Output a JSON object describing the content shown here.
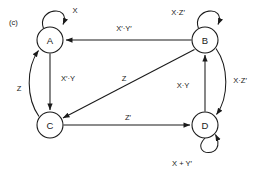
{
  "figure": {
    "caption": "(c)",
    "type": "state-transition-diagram",
    "stroke_color": "#1a1a1a",
    "background_color": "#ffffff"
  },
  "states": [
    {
      "id": "A",
      "label": "A",
      "cx": 50,
      "cy": 40,
      "r": 13
    },
    {
      "id": "B",
      "label": "B",
      "cx": 205,
      "cy": 40,
      "r": 13
    },
    {
      "id": "C",
      "label": "C",
      "cx": 50,
      "cy": 125,
      "r": 13
    },
    {
      "id": "D",
      "label": "D",
      "cx": 205,
      "cy": 125,
      "r": 13
    }
  ],
  "transitions": [
    {
      "from": "A",
      "to": "A",
      "label": "X",
      "kind": "self-loop",
      "label_x": 75,
      "label_y": 10
    },
    {
      "from": "B",
      "to": "B",
      "label": "X·Z′",
      "kind": "self-loop",
      "label_x": 178,
      "label_y": 12
    },
    {
      "from": "D",
      "to": "D",
      "label": "X + Y′",
      "kind": "self-loop",
      "label_x": 182,
      "label_y": 163
    },
    {
      "from": "B",
      "to": "A",
      "label": "X′·Y′",
      "kind": "straight",
      "label_x": 124,
      "label_y": 28
    },
    {
      "from": "A",
      "to": "C",
      "label": "X′·Y",
      "kind": "straight",
      "label_x": 68,
      "label_y": 78
    },
    {
      "from": "C",
      "to": "A",
      "label": "Z",
      "kind": "curved",
      "label_x": 19,
      "label_y": 88
    },
    {
      "from": "B",
      "to": "C",
      "label": "Z",
      "kind": "diagonal",
      "label_x": 124,
      "label_y": 78
    },
    {
      "from": "C",
      "to": "D",
      "label": "Z′",
      "kind": "straight",
      "label_x": 128,
      "label_y": 117
    },
    {
      "from": "D",
      "to": "B",
      "label": "X·Y",
      "kind": "straight",
      "label_x": 183,
      "label_y": 85
    },
    {
      "from": "B",
      "to": "D",
      "label": "X·Z′",
      "kind": "curved",
      "label_x": 240,
      "label_y": 80
    }
  ]
}
